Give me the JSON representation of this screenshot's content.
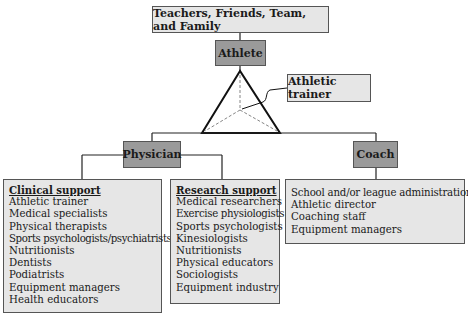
{
  "top": {
    "label": "Teachers, Friends, Team, and Family"
  },
  "athlete": {
    "label": "Athlete"
  },
  "athletic_trainer": {
    "label": "Athletic trainer"
  },
  "physician": {
    "label": "Physician",
    "clinical": {
      "heading": "Clinical support",
      "items": [
        "Athletic trainer",
        "Medical specialists",
        "Physical therapists",
        "Sports psychologists/psychiatrists",
        "Nutritionists",
        "Dentists",
        "Podiatrists",
        "Equipment managers",
        "Health educators"
      ]
    },
    "research": {
      "heading": "Research support",
      "items": [
        "Medical researchers",
        "Exercise physiologists",
        "Sports psychologists",
        "Kinesiologists",
        "Nutritionists",
        "Physical educators",
        "Sociologists",
        "Equipment industry"
      ]
    }
  },
  "coach": {
    "label": "Coach",
    "items": [
      "School and/or league administration",
      "Athletic director",
      "Coaching staff",
      "Equipment managers"
    ]
  },
  "colors": {
    "light_box": "#e6e6e6",
    "dark_box": "#9a9a9a",
    "line": "#222222"
  }
}
